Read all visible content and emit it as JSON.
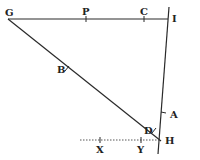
{
  "diagram": {
    "type": "geometric-construction",
    "points": {
      "G": {
        "label": "G",
        "x": 8,
        "y": 19
      },
      "P": {
        "label": "P",
        "x": 86,
        "y": 19
      },
      "C": {
        "label": "C",
        "x": 144,
        "y": 19
      },
      "I": {
        "label": "I",
        "x": 166,
        "y": 19
      },
      "B": {
        "label": "B",
        "x": 67,
        "y": 69
      },
      "D": {
        "label": "D",
        "x": 154,
        "y": 131
      },
      "A": {
        "label": "A",
        "x": 164,
        "y": 113
      },
      "H": {
        "label": "H",
        "x": 160,
        "y": 140
      },
      "X": {
        "label": "X",
        "x": 100,
        "y": 140
      },
      "Y": {
        "label": "Y",
        "x": 141,
        "y": 140
      }
    },
    "segments": [
      {
        "from": "G",
        "to": "I",
        "style": "solid"
      },
      {
        "from": "G",
        "to": "H",
        "style": "solid"
      },
      {
        "from": "I-ext-top",
        "to": "H-ext-bottom",
        "style": "solid"
      },
      {
        "from": "dotted-start",
        "to": "H",
        "style": "dotted"
      }
    ]
  }
}
